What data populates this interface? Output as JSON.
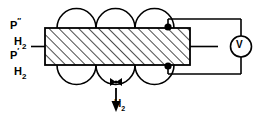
{
  "figure": {
    "kind": "electrochemical-hydrogen-permeation-cell-schematic",
    "background_color": "#ffffff",
    "line_color": "#000000"
  },
  "labels": {
    "upstream_pressure": {
      "base": "P",
      "superscript": "″",
      "subscript": "H",
      "subscript_number": "2"
    },
    "downstream_pressure": {
      "base": "P",
      "superscript": "′",
      "subscript": "H",
      "subscript_number": "2"
    },
    "gas_outlet": {
      "base": "H",
      "subscript": "2"
    },
    "voltmeter": "V"
  },
  "components": {
    "membrane": {
      "name": "hatched-membrane",
      "hatch_direction": "lower-left-to-upper-right",
      "fill": "#ffffff",
      "stroke": "#000000"
    },
    "bubbles_top_count": 3,
    "bubbles_bottom_count": 3,
    "contacts_count": 2,
    "inlet_stub": "left-horizontal-line",
    "outlet_stub": "right-horizontal-line",
    "outlet_arrow": "down-arrow"
  },
  "icons": {
    "voltmeter": "voltmeter-icon",
    "contact_dot": "contact-dot-icon",
    "down_arrow": "down-arrow-icon",
    "bowtie": "bowtie-marker-icon"
  }
}
